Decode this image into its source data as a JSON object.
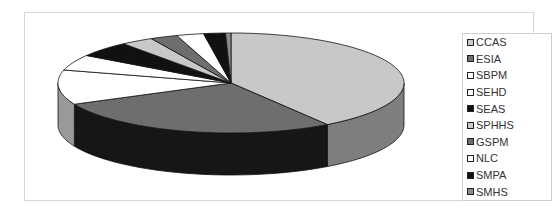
{
  "chart_data": {
    "type": "pie",
    "style": "3d-exploded-none",
    "title": "",
    "categories": [
      "CCAS",
      "ESIA",
      "SBPM",
      "SEHD",
      "SEAS",
      "SPHHS",
      "GSPM",
      "NLC",
      "SMPA",
      "SMHS"
    ],
    "values": [
      40,
      27,
      11,
      5,
      5,
      3,
      2.5,
      2.5,
      2,
      0.5
    ],
    "unit": "percent (estimated)",
    "colors": [
      "#c8c8c8",
      "#6e6e6e",
      "#ffffff",
      "#ffffff",
      "#111111",
      "#c8c8c8",
      "#6e6e6e",
      "#ffffff",
      "#111111",
      "#8a8a8a"
    ],
    "side_colors": [
      "#7e7e7e",
      "#161616",
      "#9a9a9a",
      "#9a9a9a",
      "#000000",
      "#7e7e7e",
      "#161616",
      "#9a9a9a",
      "#000000",
      "#555555"
    ],
    "start_angle": "12 o'clock",
    "direction": "clockwise",
    "legend_position": "right"
  },
  "legend": {
    "items": [
      {
        "label": "CCAS",
        "color": "#c8c8c8"
      },
      {
        "label": "ESIA",
        "color": "#6e6e6e"
      },
      {
        "label": "SBPM",
        "color": "#ffffff"
      },
      {
        "label": "SEHD",
        "color": "#ffffff"
      },
      {
        "label": "SEAS",
        "color": "#111111"
      },
      {
        "label": "SPHHS",
        "color": "#c8c8c8"
      },
      {
        "label": "GSPM",
        "color": "#6e6e6e"
      },
      {
        "label": "NLC",
        "color": "#ffffff"
      },
      {
        "label": "SMPA",
        "color": "#111111"
      },
      {
        "label": "SMHS",
        "color": "#8a8a8a"
      }
    ]
  }
}
